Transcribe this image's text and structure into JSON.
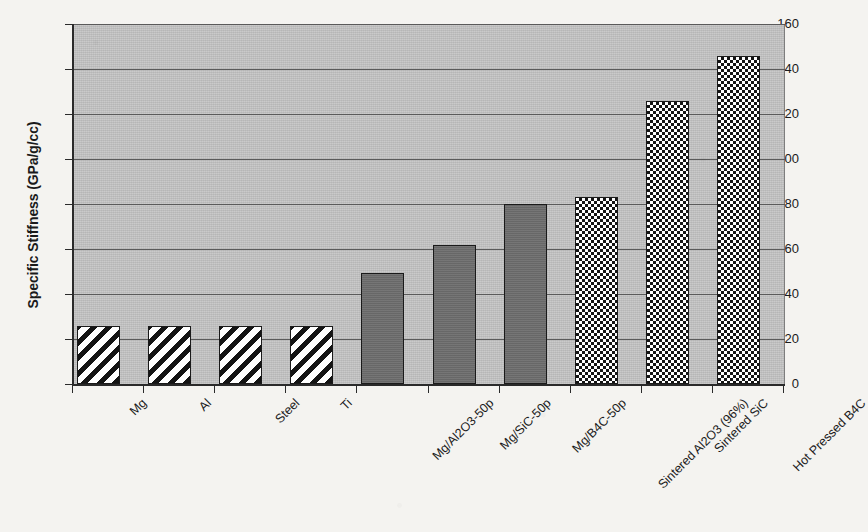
{
  "chart_data": {
    "type": "bar",
    "title": "",
    "xlabel": "",
    "ylabel": "Specific Stiffness (GPa/g/cc)",
    "ylim": [
      0,
      160
    ],
    "ytick_values": [
      0,
      20,
      40,
      60,
      80,
      100,
      120,
      140,
      160
    ],
    "ytick_labels": [
      "0",
      "20",
      "40",
      "60",
      "80",
      "100",
      "120",
      "140",
      "160"
    ],
    "grid": "horizontal",
    "legend": "none",
    "categories": [
      "Mg",
      "Al",
      "Steel",
      "Ti",
      "Mg/Al2O3-50p",
      "Mg/SiC-50p",
      "Mg/B4C-50p",
      "Sintered Al2O3 (96%)",
      "Sintered SiC",
      "Hot Pressed B4C"
    ],
    "values": [
      26,
      26,
      26,
      26,
      49.5,
      62,
      80,
      83,
      126,
      146
    ],
    "bar_fills": [
      "diagonal-hatch",
      "diagonal-hatch",
      "diagonal-hatch",
      "diagonal-hatch",
      "solid-gray",
      "solid-gray",
      "solid-gray",
      "checkerboard",
      "checkerboard",
      "checkerboard"
    ]
  },
  "colors": {
    "plot_background": "#bfbfbf",
    "page_background": "#f4f3f0",
    "axis": "#2a2a2a",
    "gridline": "#5a5a5a",
    "solid_bar": "#6d6d6d",
    "pattern_ink": "#141414"
  }
}
